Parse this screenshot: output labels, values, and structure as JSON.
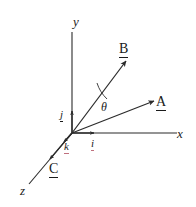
{
  "figure": {
    "background_color": "#ffffff",
    "stroke_color": "#2b2b2b",
    "accent_color": "#c0707e",
    "axes": [
      {
        "name": "x-axis",
        "label": "x"
      },
      {
        "name": "y-axis",
        "label": "y"
      },
      {
        "name": "z-axis",
        "label": "z"
      }
    ],
    "vectors": [
      {
        "name": "vector-a",
        "label": "A"
      },
      {
        "name": "vector-b",
        "label": "B"
      },
      {
        "name": "vector-c",
        "label": "C"
      }
    ],
    "unit_vectors": [
      {
        "name": "unit-i",
        "label": "i"
      },
      {
        "name": "unit-j",
        "label": "j"
      },
      {
        "name": "unit-k",
        "label": "k"
      }
    ],
    "angle": {
      "name": "angle-theta",
      "label": "θ"
    }
  }
}
